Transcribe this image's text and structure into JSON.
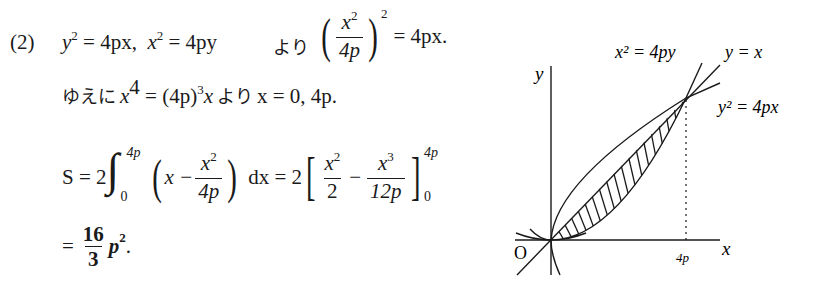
{
  "problem_label": "(2)",
  "line1": {
    "eq1_base": "y",
    "eq1_exp": "2",
    "eq1_rhs": " = 4px,",
    "eq2_base": "x",
    "eq2_exp": "2",
    "eq2_rhs": " = 4py",
    "yori": "より",
    "frac_num_base": "x",
    "frac_num_exp": "2",
    "frac_den": "4p",
    "outer_exp": "2",
    "rhs": "= 4px."
  },
  "line2": {
    "yueni": "ゆえに",
    "lhs_base": "x",
    "lhs_exp": "4",
    "mid": " = (4p)",
    "mid_exp": "3",
    "mid_tail": "x",
    "yori": "より",
    "result": "x = 0,  4p."
  },
  "line3": {
    "S": "S = 2",
    "integral": "∫",
    "upper": "4p",
    "lower": "0",
    "x_minus": "x −",
    "f1_num_base": "x",
    "f1_num_exp": "2",
    "f1_den": "4p",
    "dx": "dx = 2",
    "f2_num_base": "x",
    "f2_num_exp": "2",
    "f2_den": "2",
    "minus": "−",
    "f3_num_base": "x",
    "f3_num_exp": "3",
    "f3_den": "12p",
    "eval_upper": "4p",
    "eval_lower": "0"
  },
  "line4": {
    "eq": "=",
    "num": "16",
    "den": "3",
    "p": "p",
    "p_exp": "2",
    "period": "."
  },
  "graph": {
    "labels": {
      "y_axis": "y",
      "x_axis": "x",
      "origin": "O",
      "x_tick": "4p",
      "curve_parabola_up": "x² = 4py",
      "line": "y = x",
      "curve_parabola_right": "y² = 4px"
    },
    "colors": {
      "stroke": "#1a1a1a",
      "background": "#ffffff"
    }
  }
}
